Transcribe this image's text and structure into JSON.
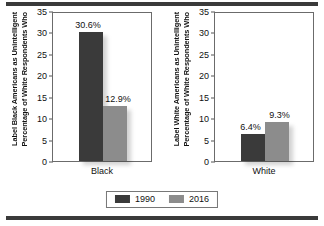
{
  "chart_data": {
    "type": "bar",
    "title": "",
    "subtitle": "",
    "xlabel": "",
    "ylim": [
      0,
      35
    ],
    "ytick_step": 5,
    "yticks": [
      35,
      30,
      25,
      20,
      15,
      10,
      5,
      0
    ],
    "grid": false,
    "legend_position": "bottom-center",
    "legend": [
      "1990",
      "2016"
    ],
    "series": [
      {
        "name": "1990",
        "color": "#3a3a3a",
        "values": [
          30.6,
          6.4
        ]
      },
      {
        "name": "2016",
        "color": "#8c8c8c",
        "values": [
          12.9,
          9.3
        ]
      }
    ],
    "categories": [
      "Black",
      "White"
    ],
    "panels": [
      {
        "ylabel_line1": "Percentage of White Respondents Who",
        "ylabel_line2": "Label Black Americans as Unintelligent",
        "category": "Black",
        "bars": [
          {
            "series": "1990",
            "value": 30.6,
            "label": "30.6%",
            "color": "#3a3a3a"
          },
          {
            "series": "2016",
            "value": 12.9,
            "label": "12.9%",
            "color": "#8c8c8c"
          }
        ]
      },
      {
        "ylabel_line1": "Percentage of White Respondents Who",
        "ylabel_line2": "Label White Americans as Unintelligent",
        "category": "White",
        "bars": [
          {
            "series": "1990",
            "value": 6.4,
            "label": "6.4%",
            "color": "#3a3a3a"
          },
          {
            "series": "2016",
            "value": 9.3,
            "label": "9.3%",
            "color": "#8c8c8c"
          }
        ]
      }
    ]
  },
  "axis": {
    "t35": "35",
    "t30": "30",
    "t25": "25",
    "t20": "20",
    "t15": "15",
    "t10": "10",
    "t5": "5",
    "t0": "0"
  },
  "colors": {
    "series_1990": "#3a3a3a",
    "series_2016": "#8c8c8c",
    "rule": "#3a3a3a",
    "frame": "#6b6b6b"
  }
}
